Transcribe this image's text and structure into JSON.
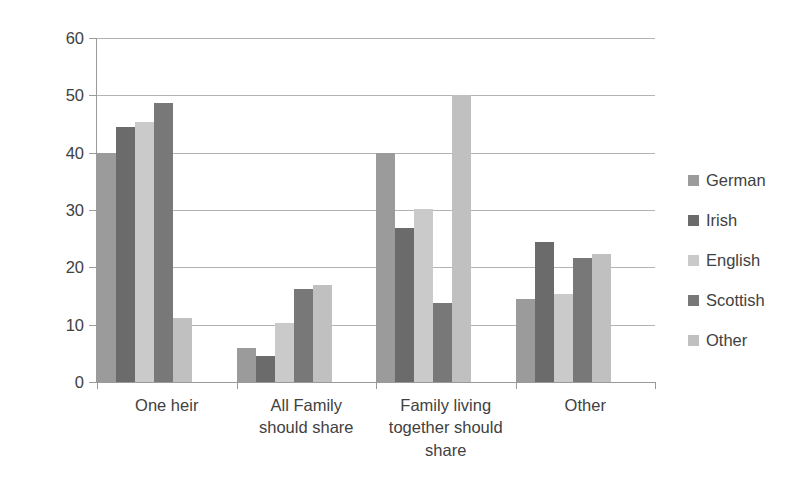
{
  "chart_data": {
    "type": "bar",
    "title": "",
    "subtitle": "",
    "xlabel": "",
    "ylabel": "",
    "ylim": [
      0,
      60
    ],
    "ytick_step": 10,
    "yticks": [
      60,
      50,
      40,
      30,
      20,
      10,
      0
    ],
    "grid": true,
    "grid_axis": "y",
    "legend_position": "right",
    "categories": [
      "One heir",
      "All Family should share",
      "Family living together should share",
      "Other"
    ],
    "category_lines": [
      [
        "One heir"
      ],
      [
        "All Family",
        "should share"
      ],
      [
        "Family living",
        "together should",
        "share"
      ],
      [
        "Other"
      ]
    ],
    "series": [
      {
        "name": "German",
        "color": "#9b9b9b",
        "values": [
          40.0,
          5.9,
          40.0,
          14.5
        ]
      },
      {
        "name": "Irish",
        "color": "#6b6b6b",
        "values": [
          44.5,
          4.5,
          26.8,
          24.5
        ]
      },
      {
        "name": "English",
        "color": "#cacaca",
        "values": [
          45.3,
          10.3,
          30.2,
          15.3
        ]
      },
      {
        "name": "Scottish",
        "color": "#787878",
        "values": [
          48.7,
          16.3,
          13.7,
          21.7
        ]
      },
      {
        "name": "Other",
        "color": "#c0c0c0",
        "values": [
          11.2,
          16.9,
          50.0,
          22.3
        ]
      }
    ]
  },
  "axes": {
    "y_tick_labels": [
      "60",
      "50",
      "40",
      "30",
      "20",
      "10",
      "0"
    ]
  },
  "legend": {
    "items": [
      {
        "label": "German",
        "color": "#9b9b9b"
      },
      {
        "label": "Irish",
        "color": "#6b6b6b"
      },
      {
        "label": "English",
        "color": "#cacaca"
      },
      {
        "label": "Scottish",
        "color": "#787878"
      },
      {
        "label": "Other",
        "color": "#c0c0c0"
      }
    ]
  },
  "colors": {
    "background": "#ffffff",
    "gridline": "#b3b3b3",
    "axis": "#9a9a9a",
    "text": "#414141"
  }
}
